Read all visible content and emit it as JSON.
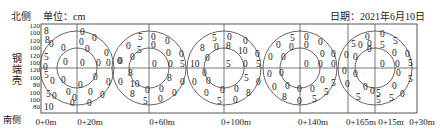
{
  "header": {
    "north_label": "北侧",
    "unit_label": "单位：cm",
    "date_label": "日期：2021年6月10日"
  },
  "side_label": [
    "钢",
    "端",
    "壳"
  ],
  "south_label": "南侧",
  "y_axis_labels": [
    "120",
    "100",
    "120",
    "100",
    "120",
    "100",
    "120",
    "100",
    "80",
    "100",
    "100",
    "80"
  ],
  "x_axis_labels": [
    {
      "text": "0+0m",
      "x": 46
    },
    {
      "text": "0+20m",
      "x": 90
    },
    {
      "text": "0+60m",
      "x": 162
    },
    {
      "text": "0+100m",
      "x": 236
    },
    {
      "text": "0+140m",
      "x": 313
    },
    {
      "text": "0+165m",
      "x": 361
    },
    {
      "text": "0+15m",
      "x": 391
    },
    {
      "text": "0+30m",
      "x": 422
    }
  ],
  "frame": {
    "left": 41,
    "top": 24,
    "right": 417,
    "bottom": 113,
    "mid_y": 68
  },
  "vertical_lines": [
    77,
    149,
    224,
    300,
    348,
    375
  ],
  "circles": [
    {
      "cx": 77,
      "outer_r": 37,
      "inner_r": 20
    },
    {
      "cx": 149,
      "outer_r": 37,
      "inner_r": 20
    },
    {
      "cx": 224,
      "outer_r": 37,
      "inner_r": 20
    },
    {
      "cx": 300,
      "outer_r": 37,
      "inner_r": 20
    },
    {
      "cx": 375,
      "outer_r": 37,
      "inner_r": 20
    }
  ],
  "left_edge_values": [
    {
      "t": "8",
      "x": 44,
      "y": 34
    },
    {
      "t": "8",
      "x": 45,
      "y": 43
    },
    {
      "t": "5",
      "x": 44,
      "y": 60
    },
    {
      "t": "0",
      "x": 43,
      "y": 70
    },
    {
      "t": "5",
      "x": 44,
      "y": 78
    },
    {
      "t": "5",
      "x": 46,
      "y": 97
    },
    {
      "t": "10",
      "x": 44,
      "y": 110
    }
  ],
  "readings": [
    {
      "circle": 1,
      "values": [
        {
          "t": "0",
          "x": 49,
          "y": 47
        },
        {
          "t": "0",
          "x": 61,
          "y": 51
        },
        {
          "t": "0",
          "x": 63,
          "y": 65
        },
        {
          "t": "0",
          "x": 80,
          "y": 35
        },
        {
          "t": "0",
          "x": 92,
          "y": 41
        },
        {
          "t": "0",
          "x": 79,
          "y": 45
        },
        {
          "t": "0",
          "x": 85,
          "y": 52
        },
        {
          "t": "0",
          "x": 104,
          "y": 56
        },
        {
          "t": "0",
          "x": 80,
          "y": 66
        },
        {
          "t": "0",
          "x": 96,
          "y": 66
        },
        {
          "t": "0",
          "x": 106,
          "y": 66
        },
        {
          "t": "0",
          "x": 50,
          "y": 84
        },
        {
          "t": "0",
          "x": 61,
          "y": 83
        },
        {
          "t": "0",
          "x": 66,
          "y": 95
        },
        {
          "t": "0",
          "x": 78,
          "y": 88
        },
        {
          "t": "0",
          "x": 93,
          "y": 80
        },
        {
          "t": "0",
          "x": 106,
          "y": 85
        },
        {
          "t": "0",
          "x": 52,
          "y": 99
        },
        {
          "t": "0",
          "x": 72,
          "y": 101
        },
        {
          "t": "0",
          "x": 88,
          "y": 95
        },
        {
          "t": "0",
          "x": 100,
          "y": 98
        },
        {
          "t": "0",
          "x": 70,
          "y": 106
        },
        {
          "t": "0",
          "x": 87,
          "y": 106
        }
      ]
    },
    {
      "circle": 2,
      "values": [
        {
          "t": "5",
          "x": 138,
          "y": 40
        },
        {
          "t": "0",
          "x": 151,
          "y": 40
        },
        {
          "t": "0",
          "x": 165,
          "y": 44
        },
        {
          "t": "0",
          "x": 126,
          "y": 49
        },
        {
          "t": "5",
          "x": 137,
          "y": 53
        },
        {
          "t": "0",
          "x": 151,
          "y": 48
        },
        {
          "t": "0",
          "x": 166,
          "y": 56
        },
        {
          "t": "0",
          "x": 179,
          "y": 57
        },
        {
          "t": "0",
          "x": 130,
          "y": 60
        },
        {
          "t": "0",
          "x": 117,
          "y": 64
        },
        {
          "t": "0",
          "x": 118,
          "y": 64
        },
        {
          "t": "0",
          "x": 152,
          "y": 67
        },
        {
          "t": "0",
          "x": 168,
          "y": 67
        },
        {
          "t": "5",
          "x": 180,
          "y": 67
        },
        {
          "t": "8",
          "x": 128,
          "y": 76
        },
        {
          "t": "8",
          "x": 167,
          "y": 81
        },
        {
          "t": "0",
          "x": 118,
          "y": 85
        },
        {
          "t": "10",
          "x": 130,
          "y": 87
        },
        {
          "t": "0",
          "x": 180,
          "y": 85
        },
        {
          "t": "8",
          "x": 130,
          "y": 97
        },
        {
          "t": "0",
          "x": 145,
          "y": 93
        },
        {
          "t": "0",
          "x": 159,
          "y": 92
        },
        {
          "t": "0",
          "x": 172,
          "y": 96
        },
        {
          "t": "5",
          "x": 143,
          "y": 104
        },
        {
          "t": "0",
          "x": 158,
          "y": 102
        }
      ]
    },
    {
      "circle": 3,
      "values": [
        {
          "t": "5",
          "x": 212,
          "y": 41
        },
        {
          "t": "0",
          "x": 227,
          "y": 40
        },
        {
          "t": "0",
          "x": 243,
          "y": 44
        },
        {
          "t": "8",
          "x": 200,
          "y": 51
        },
        {
          "t": "0",
          "x": 214,
          "y": 50
        },
        {
          "t": "8",
          "x": 226,
          "y": 49
        },
        {
          "t": "10",
          "x": 238,
          "y": 54
        },
        {
          "t": "0",
          "x": 255,
          "y": 57
        },
        {
          "t": "0",
          "x": 205,
          "y": 61
        },
        {
          "t": "10",
          "x": 190,
          "y": 67
        },
        {
          "t": "5",
          "x": 226,
          "y": 67
        },
        {
          "t": "0",
          "x": 243,
          "y": 67
        },
        {
          "t": "5",
          "x": 256,
          "y": 67
        },
        {
          "t": "0",
          "x": 202,
          "y": 76
        },
        {
          "t": "5",
          "x": 244,
          "y": 81
        },
        {
          "t": "0",
          "x": 192,
          "y": 85
        },
        {
          "t": "0",
          "x": 206,
          "y": 84
        },
        {
          "t": "0",
          "x": 256,
          "y": 85
        },
        {
          "t": "0",
          "x": 204,
          "y": 96
        },
        {
          "t": "0",
          "x": 220,
          "y": 93
        },
        {
          "t": "0",
          "x": 234,
          "y": 92
        },
        {
          "t": "8",
          "x": 246,
          "y": 96
        },
        {
          "t": "5",
          "x": 217,
          "y": 104
        },
        {
          "t": "0",
          "x": 233,
          "y": 103
        }
      ]
    },
    {
      "circle": 4,
      "values": [
        {
          "t": "5",
          "x": 290,
          "y": 41
        },
        {
          "t": "0",
          "x": 304,
          "y": 40
        },
        {
          "t": "0",
          "x": 318,
          "y": 45
        },
        {
          "t": "0",
          "x": 276,
          "y": 48
        },
        {
          "t": "0",
          "x": 289,
          "y": 50
        },
        {
          "t": "0",
          "x": 304,
          "y": 48
        },
        {
          "t": "0",
          "x": 320,
          "y": 57
        },
        {
          "t": "0",
          "x": 331,
          "y": 57
        },
        {
          "t": "0",
          "x": 281,
          "y": 60
        },
        {
          "t": "0",
          "x": 268,
          "y": 60
        },
        {
          "t": "0",
          "x": 304,
          "y": 67
        },
        {
          "t": "0",
          "x": 318,
          "y": 67
        },
        {
          "t": "0",
          "x": 331,
          "y": 67
        },
        {
          "t": "0",
          "x": 267,
          "y": 77
        },
        {
          "t": "0",
          "x": 279,
          "y": 76
        },
        {
          "t": "0",
          "x": 320,
          "y": 83
        },
        {
          "t": "5",
          "x": 331,
          "y": 86
        },
        {
          "t": "0",
          "x": 272,
          "y": 90
        },
        {
          "t": "0",
          "x": 285,
          "y": 89
        },
        {
          "t": "0",
          "x": 297,
          "y": 92
        },
        {
          "t": "0",
          "x": 310,
          "y": 92
        },
        {
          "t": "5",
          "x": 324,
          "y": 95
        },
        {
          "t": "8",
          "x": 282,
          "y": 100
        },
        {
          "t": "0",
          "x": 297,
          "y": 104
        },
        {
          "t": "5",
          "x": 312,
          "y": 102
        }
      ]
    },
    {
      "circle": 5,
      "values": [
        {
          "t": "0",
          "x": 365,
          "y": 40
        },
        {
          "t": "0",
          "x": 380,
          "y": 37
        },
        {
          "t": "5",
          "x": 393,
          "y": 44
        },
        {
          "t": "5",
          "x": 351,
          "y": 47
        },
        {
          "t": "0",
          "x": 358,
          "y": 48
        },
        {
          "t": "0",
          "x": 367,
          "y": 52
        },
        {
          "t": "0",
          "x": 367,
          "y": 47
        },
        {
          "t": "5",
          "x": 380,
          "y": 48
        },
        {
          "t": "0",
          "x": 392,
          "y": 56
        },
        {
          "t": "0",
          "x": 405,
          "y": 57
        },
        {
          "t": "0",
          "x": 344,
          "y": 58
        },
        {
          "t": "0",
          "x": 353,
          "y": 60
        },
        {
          "t": "0",
          "x": 380,
          "y": 67
        },
        {
          "t": "0",
          "x": 395,
          "y": 67
        },
        {
          "t": "5",
          "x": 408,
          "y": 66
        },
        {
          "t": "0",
          "x": 342,
          "y": 74
        },
        {
          "t": "0",
          "x": 353,
          "y": 77
        },
        {
          "t": "0",
          "x": 396,
          "y": 76
        },
        {
          "t": "5",
          "x": 408,
          "y": 82
        },
        {
          "t": "0",
          "x": 345,
          "y": 87
        },
        {
          "t": "0",
          "x": 363,
          "y": 90
        },
        {
          "t": "0",
          "x": 392,
          "y": 89
        },
        {
          "t": "0",
          "x": 400,
          "y": 97
        },
        {
          "t": "0",
          "x": 370,
          "y": 94
        },
        {
          "t": "5",
          "x": 376,
          "y": 96
        },
        {
          "t": "5",
          "x": 356,
          "y": 100
        },
        {
          "t": "5",
          "x": 376,
          "y": 103
        },
        {
          "t": "5",
          "x": 389,
          "y": 101
        }
      ]
    }
  ]
}
